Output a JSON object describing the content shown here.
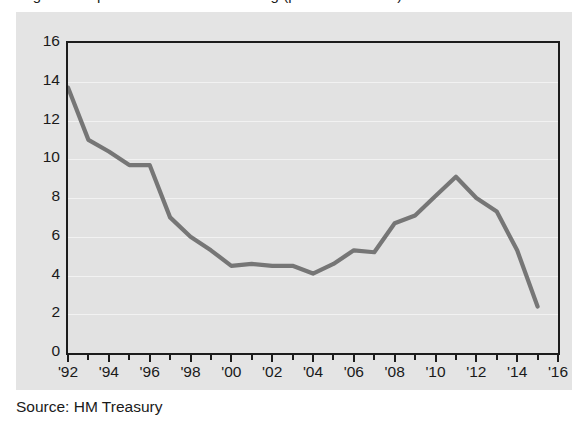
{
  "figure": {
    "title_cropped": "Figure: UK public sector net borrowing (per cent of GDP)",
    "source_label": "Source: HM Treasury"
  },
  "colors": {
    "page_background": "#ffffff",
    "card_background": "#e4e4e4",
    "plot_background": "#e2e2e2",
    "gridline": "#f2f2f2",
    "axis": "#1c1c1c",
    "line": "#767676",
    "text": "#1a1a1a"
  },
  "chart_data": {
    "type": "line",
    "title": "",
    "xlabel": "",
    "ylabel": "",
    "xlim": [
      1992,
      2016
    ],
    "ylim": [
      0,
      16
    ],
    "ytick_step": 2,
    "yticks": [
      0,
      2,
      4,
      6,
      8,
      10,
      12,
      14,
      16
    ],
    "ytick_labels": [
      "0",
      "2",
      "4",
      "6",
      "8",
      "10",
      "12",
      "14",
      "16"
    ],
    "xticks": [
      1992,
      1994,
      1996,
      1998,
      2000,
      2002,
      2004,
      2006,
      2008,
      2010,
      2012,
      2014,
      2016
    ],
    "xtick_labels": [
      "'92",
      "'94",
      "'96",
      "'98",
      "'00",
      "'02",
      "'04",
      "'06",
      "'08",
      "'10",
      "'12",
      "'14",
      "'16"
    ],
    "xtick_minor": [
      1993,
      1995,
      1997,
      1999,
      2001,
      2003,
      2005,
      2007,
      2009,
      2011,
      2013,
      2015
    ],
    "grid": true,
    "grid_axis": "y",
    "legend": false,
    "legend_position": "none",
    "series": [
      {
        "name": "value",
        "x": [
          1992,
          1993,
          1994,
          1995,
          1996,
          1997,
          1998,
          1999,
          2000,
          2001,
          2002,
          2003,
          2004,
          2005,
          2006,
          2007,
          2008,
          2009,
          2010,
          2011,
          2012,
          2013,
          2014,
          2015
        ],
        "values": [
          13.7,
          11.0,
          10.4,
          9.7,
          9.7,
          7.0,
          6.0,
          5.3,
          4.5,
          4.6,
          4.5,
          4.5,
          4.1,
          4.6,
          5.3,
          5.2,
          6.7,
          7.1,
          8.1,
          9.1,
          8.0,
          7.3,
          5.3,
          2.4
        ]
      }
    ],
    "annotations": []
  }
}
